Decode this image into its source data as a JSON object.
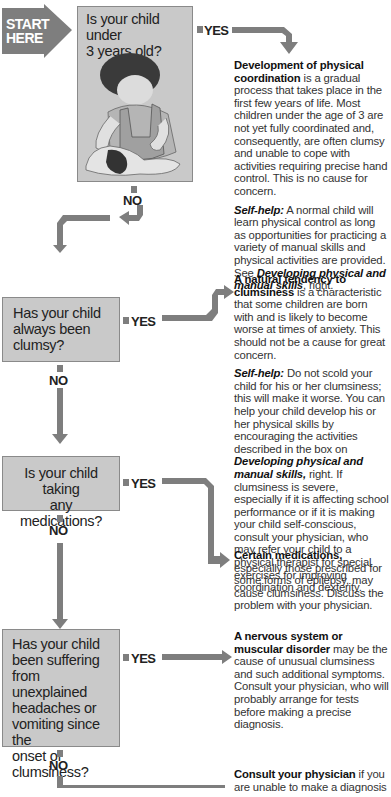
{
  "start": {
    "label_line1": "START",
    "label_line2": "HERE"
  },
  "questions": [
    {
      "id": "q1",
      "text_lines": [
        "Is your child under",
        "3 years old?"
      ],
      "yes_label": "YES",
      "no_label": "NO"
    },
    {
      "id": "q2",
      "text_lines": [
        "Has your child",
        "always been",
        "clumsy?"
      ],
      "yes_label": "YES",
      "no_label": "NO"
    },
    {
      "id": "q3",
      "text_lines": [
        "Is your child taking",
        "any medications?"
      ],
      "yes_label": "YES",
      "no_label": "NO"
    },
    {
      "id": "q4",
      "text_lines": [
        "Has your child",
        "been suffering",
        "from unexplained",
        "headaches or",
        "vomiting since the",
        "onset of",
        "clumsiness?"
      ],
      "yes_label": "YES",
      "no_label": "NO"
    }
  ],
  "answers": [
    {
      "id": "a1",
      "heading": "Development of physical coordination",
      "body": " is a gradual process that takes place in the first few years of life. Most children under the age of 3 are not yet fully coordinated and, consequently, are often clumsy and unable to cope with activities requiring precise hand control. This is no cause for concern.",
      "selfhelp_label": "Self-help:",
      "selfhelp_body": " A normal child will learn physical control as long as opportunities for practicing a variety of manual skills and physical activities are provided. See ",
      "selfhelp_link": "Developing physical and manual skills",
      "selfhelp_tail": ", right."
    },
    {
      "id": "a2",
      "heading": "A natural tendency to clumsiness",
      "body": " is a characteristic that some children are born with and is likely to become worse at times of anxiety. This should not be a cause for great concern.",
      "selfhelp_label": "Self-help:",
      "selfhelp_body": " Do not scold your child for his or her clumsiness; this will make it worse. You can help your child develop his or her physical skills by encouraging the activities described in the box on ",
      "selfhelp_link": "Developing physical and manual skills,",
      "selfhelp_tail": " right. If clumsiness is severe, especially if it is affecting school performance or if it is making your child self-conscious, consult your physician, who may refer your child to a physical therapist for special exercises for improving coordination and dexterity."
    },
    {
      "id": "a3",
      "heading": "Certain medications,",
      "body": " especially those prescribed for some forms of epilepsy, may cause clumsiness. Discuss the problem with your physician."
    },
    {
      "id": "a4",
      "heading": "A nervous system or muscular disorder",
      "body": " may be the cause of unusual clumsiness and such additional symptoms. Consult your physician, who will probably arrange for tests before making a precise diagnosis."
    },
    {
      "id": "a5",
      "heading": "Consult your physician",
      "body": " if you are unable to make a diagnosis"
    }
  ],
  "colors": {
    "box_fill": "#c9c9c9",
    "box_border": "#8a8a8a",
    "arrow": "#7e7e7e",
    "text": "#333333"
  }
}
